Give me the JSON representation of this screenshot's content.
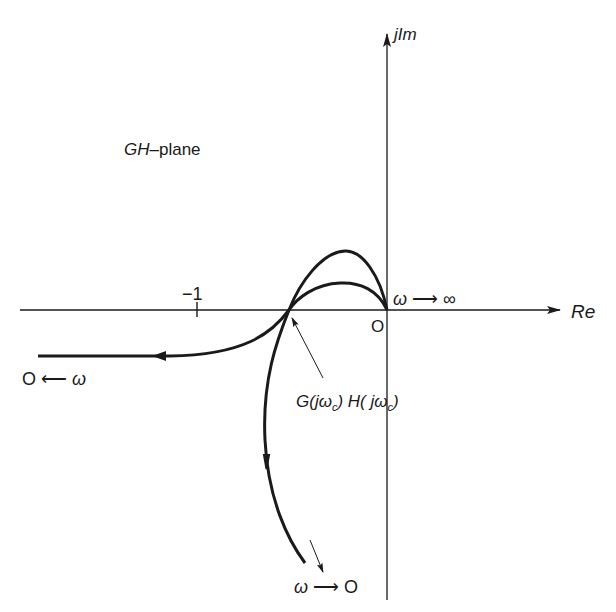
{
  "figure": {
    "plane_label": "GH–plane",
    "plane_label_parts": {
      "italic": "GH",
      "rest": "–plane"
    },
    "axes": {
      "real_label": "Re",
      "imag_label": "jIm",
      "origin_label": "O",
      "real_tick_label": "−1"
    },
    "annotations": {
      "omega_to_infinity": "ω → ∞",
      "omega_to_zero_bottom": "ω → O",
      "zero_from_omega_left": "O ← ω",
      "crossing_point_label": "G(jωc) H(jωc)",
      "crossing_parts": {
        "g": "G(jω",
        "sub1": "c",
        "h": ") H( jω",
        "sub2": "c",
        "close": ")"
      }
    },
    "curves": [
      {
        "name": "outer-polar-plot",
        "description": "From origin (ω→∞) arcs up through upper half-plane, crosses real axis between -1 and 0, then descends toward ω→0 at bottom"
      },
      {
        "name": "inner-polar-plot",
        "description": "From origin arcs up (lower arch), crosses real axis at same point, then bends left to horizontal asymptote going left (ω→0)"
      }
    ],
    "colors": {
      "ink": "#1a1a1a",
      "background": "#ffffff"
    }
  }
}
